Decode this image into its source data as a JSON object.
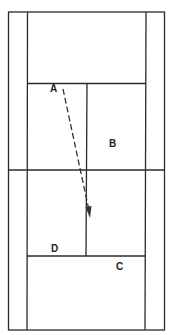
{
  "diagram": {
    "type": "tennis-court-top-view",
    "colors": {
      "line": "#2a2a2a",
      "background": "#ffffff",
      "path": "#333333"
    },
    "labels": [
      {
        "id": "A",
        "text": "A",
        "x": 50,
        "y": 84
      },
      {
        "id": "B",
        "text": "B",
        "x": 109,
        "y": 139
      },
      {
        "id": "C",
        "text": "C",
        "x": 116,
        "y": 262
      },
      {
        "id": "D",
        "text": "D",
        "x": 51,
        "y": 244
      }
    ],
    "path": {
      "style": "dashed-arrow",
      "from": "A",
      "start": [
        63,
        89
      ],
      "end": [
        90,
        217
      ]
    }
  }
}
